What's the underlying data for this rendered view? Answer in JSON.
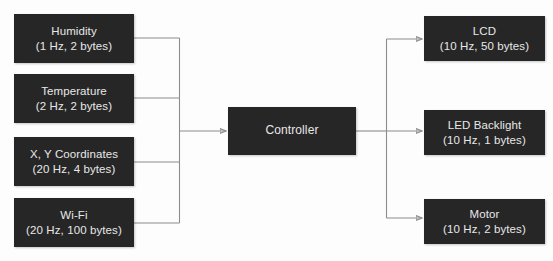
{
  "diagram": {
    "type": "block-diagram",
    "background_color": "#fdfdfd",
    "box_color": "#262626",
    "box_text_color": "#e8e8e8",
    "wire_color": "#8c8c8c",
    "inputs": [
      {
        "id": "humidity",
        "title": "Humidity",
        "spec": "(1 Hz, 2 bytes)"
      },
      {
        "id": "temperature",
        "title": "Temperature",
        "spec": "(2 Hz, 2 bytes)"
      },
      {
        "id": "coordinates",
        "title": "X, Y Coordinates",
        "spec": "(20 Hz, 4 bytes)"
      },
      {
        "id": "wifi",
        "title": "Wi-Fi",
        "spec": "(20 Hz, 100 bytes)"
      }
    ],
    "controller": {
      "id": "controller",
      "title": "Controller"
    },
    "outputs": [
      {
        "id": "lcd",
        "title": "LCD",
        "spec": "(10 Hz, 50 bytes)"
      },
      {
        "id": "led-backlight",
        "title": "LED Backlight",
        "spec": "(10 Hz, 1 bytes)"
      },
      {
        "id": "motor",
        "title": "Motor",
        "spec": "(10 Hz, 2 bytes)"
      }
    ]
  }
}
